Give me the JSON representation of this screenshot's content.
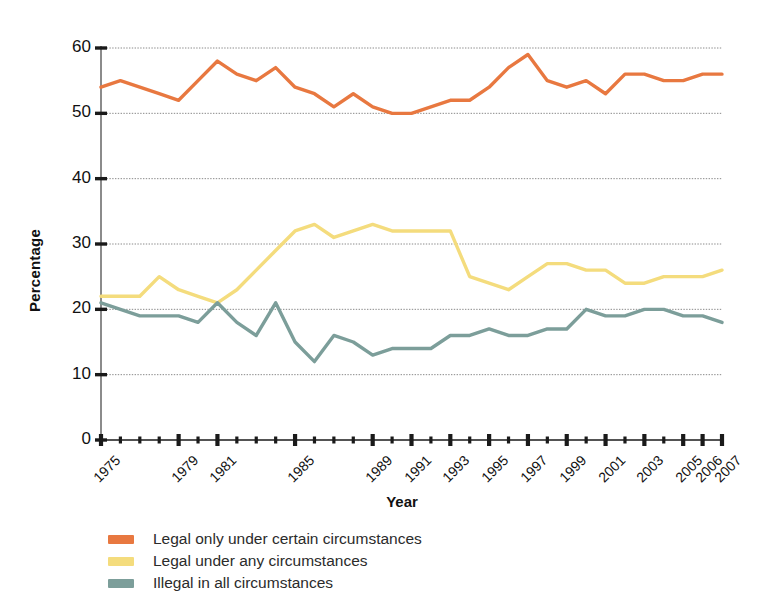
{
  "chart_data": {
    "type": "line",
    "title": "",
    "xlabel": "Year",
    "ylabel": "Percentage",
    "ylim": [
      0,
      60
    ],
    "yticks": [
      0,
      10,
      20,
      30,
      40,
      50,
      60
    ],
    "grid": "horizontal",
    "legend_position": "bottom-left",
    "x": [
      1975,
      1976,
      1977,
      1978,
      1979,
      1980,
      1981,
      1982,
      1983,
      1984,
      1985,
      1986,
      1987,
      1988,
      1989,
      1990,
      1991,
      1992,
      1993,
      1994,
      1995,
      1996,
      1997,
      1998,
      1999,
      2000,
      2001,
      2002,
      2003,
      2004,
      2005,
      2006,
      2007
    ],
    "xtick_labels": [
      "1975",
      "",
      "",
      "",
      "1979",
      "",
      "1981",
      "",
      "",
      "",
      "1985",
      "",
      "",
      "",
      "1989",
      "",
      "1991",
      "",
      "1993",
      "",
      "1995",
      "",
      "1997",
      "",
      "1999",
      "",
      "2001",
      "",
      "2003",
      "",
      "2005",
      "2006",
      "2007"
    ],
    "series": [
      {
        "name": "Legal only under certain circumstances",
        "color": "#E87840",
        "values": [
          54,
          55,
          54,
          53,
          52,
          55,
          58,
          56,
          55,
          57,
          54,
          53,
          51,
          53,
          51,
          50,
          50,
          51,
          52,
          52,
          54,
          57,
          59,
          55,
          54,
          55,
          53,
          56,
          56,
          55,
          55,
          56,
          56
        ]
      },
      {
        "name": "Legal under any circumstances",
        "color": "#F4DC7D",
        "values": [
          22,
          22,
          22,
          25,
          23,
          22,
          21,
          23,
          26,
          29,
          32,
          33,
          31,
          32,
          33,
          32,
          32,
          32,
          32,
          25,
          24,
          23,
          25,
          27,
          27,
          26,
          26,
          24,
          24,
          25,
          25,
          25,
          26
        ]
      },
      {
        "name": "Illegal in all circumstances",
        "color": "#7C9E9A",
        "values": [
          21,
          20,
          19,
          19,
          19,
          18,
          21,
          18,
          16,
          21,
          15,
          12,
          16,
          15,
          13,
          14,
          14,
          14,
          16,
          16,
          17,
          16,
          16,
          17,
          17,
          20,
          19,
          19,
          20,
          20,
          19,
          19,
          18
        ]
      }
    ]
  },
  "legend": {
    "items": [
      {
        "label": "Legal only under certain circumstances",
        "color": "#E87840"
      },
      {
        "label": "Legal under any circumstances",
        "color": "#F4DC7D"
      },
      {
        "label": "Illegal in all circumstances",
        "color": "#7C9E9A"
      }
    ]
  }
}
